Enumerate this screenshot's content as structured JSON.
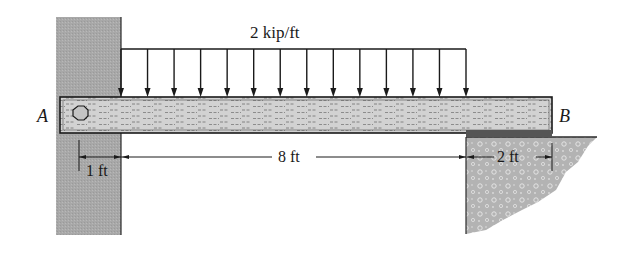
{
  "diagram": {
    "type": "beam-loading-diagram",
    "load": {
      "label": "2 kip/ft",
      "kind": "uniformly-distributed",
      "arrow_count": 14,
      "start_x": 121,
      "end_x": 466,
      "top_y": 49,
      "bottom_y": 97
    },
    "points": {
      "A": "A",
      "B": "B"
    },
    "dimensions": [
      {
        "id": "dim-1ft",
        "label": "1 ft"
      },
      {
        "id": "dim-8ft",
        "label": "8 ft"
      },
      {
        "id": "dim-2ft",
        "label": "2 ft"
      }
    ],
    "colors": {
      "wall": "#a9a9a9",
      "beam_fill": "#cfcfcf",
      "support": "#b5b5b5",
      "line": "#1a1a1a",
      "background": "#ffffff"
    }
  }
}
